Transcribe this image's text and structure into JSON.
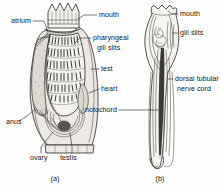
{
  "figure": {
    "style": "black-and-white line drawing",
    "panels": [
      {
        "id": "a",
        "caption": "(a)",
        "subject": "adult sea squirt (ascidian) sectional view",
        "labels": [
          {
            "key": "atrium",
            "text": "atrium",
            "x": 11,
            "y": 23,
            "anchor": "start",
            "lines": [
              "atrium"
            ]
          },
          {
            "key": "mouth",
            "text": "mouth",
            "x": 99,
            "y": 17,
            "anchor": "start",
            "lines": [
              "mouth"
            ]
          },
          {
            "key": "pharyngeal-gill-slits",
            "text": "pharyngeal gill slits",
            "x": 93,
            "y": 40,
            "anchor": "start",
            "lines": [
              "pharyngeal",
              "gill slits"
            ]
          },
          {
            "key": "test",
            "text": "test",
            "x": 101,
            "y": 71,
            "anchor": "start",
            "lines": [
              "test"
            ]
          },
          {
            "key": "heart",
            "text": "heart",
            "x": 101,
            "y": 91,
            "anchor": "start",
            "lines": [
              "heart"
            ]
          },
          {
            "key": "anus",
            "text": "anus",
            "x": 6,
            "y": 124,
            "anchor": "start",
            "lines": [
              "anus"
            ]
          },
          {
            "key": "ovary",
            "text": "ovary",
            "x": 30,
            "y": 160,
            "anchor": "start",
            "lines": [
              "ovary"
            ]
          },
          {
            "key": "testis",
            "text": "testis",
            "x": 60,
            "y": 160,
            "anchor": "start",
            "lines": [
              "testis"
            ]
          }
        ]
      },
      {
        "id": "b",
        "caption": "(b)",
        "subject": "tadpole larva",
        "labels": [
          {
            "key": "mouth-larva",
            "text": "mouth",
            "x": 180,
            "y": 16,
            "anchor": "start",
            "lines": [
              "mouth"
            ]
          },
          {
            "key": "gill-slits-larva",
            "text": "gill slits",
            "x": 180,
            "y": 35,
            "anchor": "start",
            "lines": [
              "gill slits"
            ]
          },
          {
            "key": "dorsal-tubular-nerve-cord",
            "text": "dorsal tubular nerve cord",
            "x": 175,
            "y": 81,
            "anchor": "start",
            "lines": [
              "dorsal tubular",
              "nerve cord"
            ]
          },
          {
            "key": "notochord",
            "text": "notochord",
            "x": 117,
            "y": 112,
            "anchor": "end",
            "lines": [
              "notochord"
            ]
          }
        ]
      }
    ]
  },
  "colors": {
    "ink": "#2a2724",
    "paper": "#fdfdfb",
    "tunic": "#ece9e4",
    "atrium": "#ded9d2",
    "organ": "#dcd7cf",
    "dark": "#5d5953"
  }
}
